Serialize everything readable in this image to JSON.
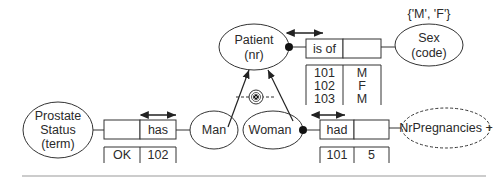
{
  "entities": {
    "patient": {
      "line1": "Patient",
      "line2": "(nr)"
    },
    "sex": {
      "line1": "Sex",
      "line2": "(code)",
      "value_constraint": "{'M', 'F'}"
    },
    "prostate_status": {
      "line1": "Prostate",
      "line2": "Status",
      "line3": "(term)"
    },
    "man": {
      "label": "Man"
    },
    "woman": {
      "label": "Woman"
    },
    "nr_pregnancies": {
      "label": "NrPregnancies +"
    }
  },
  "fact_types": {
    "patient_sex": {
      "reading": "is of",
      "rows": [
        [
          "101",
          "M"
        ],
        [
          "102",
          "F"
        ],
        [
          "103",
          "M"
        ]
      ]
    },
    "man_prostate": {
      "reading": "has",
      "rows": [
        [
          "OK",
          "102"
        ]
      ]
    },
    "woman_pregnancies": {
      "reading": "had",
      "rows": [
        [
          "101",
          "5"
        ]
      ]
    }
  },
  "constraints": {
    "subtype_exclusion": "exclusive-or"
  },
  "colors": {
    "stroke": "#333333",
    "text": "#2a2a2a",
    "separator": "#bbbbbb"
  }
}
